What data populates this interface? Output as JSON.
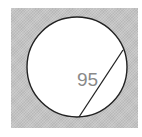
{
  "diagram": {
    "type": "circle-with-chord",
    "label": "95",
    "colors": {
      "background": "#c4c4c4",
      "circle_fill": "#ffffff",
      "stroke": "#222222",
      "label": "#8a8a8a"
    }
  }
}
